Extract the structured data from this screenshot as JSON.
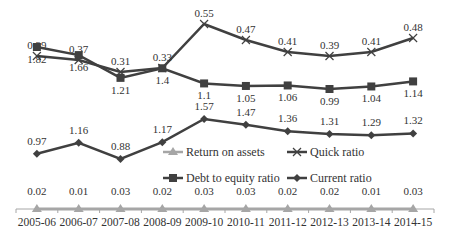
{
  "chart_data": {
    "type": "line",
    "title": "",
    "xlabel": "",
    "ylabel": "",
    "grid": false,
    "y_axis_visible": false,
    "legend_position": "center",
    "categories": [
      "2005-06",
      "2006-07",
      "2007-08",
      "2008-09",
      "2009-10",
      "2010-11",
      "2011-12",
      "2012-13",
      "2013-14",
      "2014-15"
    ],
    "series": [
      {
        "name": "Quick ratio",
        "marker": "x",
        "color": "#404040",
        "values": [
          0.39,
          0.37,
          0.31,
          0.33,
          0.55,
          0.47,
          0.41,
          0.39,
          0.41,
          0.48
        ],
        "labels": [
          "0.39",
          "0.37",
          "0.31",
          "0.33",
          "0.55",
          "0.47",
          "0.41",
          "0.39",
          "0.41",
          "0.48"
        ]
      },
      {
        "name": "Debt to equity ratio",
        "marker": "square",
        "color": "#404040",
        "values": [
          1.82,
          1.66,
          1.21,
          1.4,
          1.1,
          1.05,
          1.06,
          0.99,
          1.04,
          1.14
        ],
        "labels": [
          "1.82",
          "1.66",
          "1.21",
          "1.4",
          "1.1",
          "1.05",
          "1.06",
          "0.99",
          "1.04",
          "1.14"
        ]
      },
      {
        "name": "Current ratio",
        "marker": "diamond",
        "color": "#404040",
        "values": [
          0.97,
          1.16,
          0.88,
          1.17,
          1.57,
          1.47,
          1.36,
          1.31,
          1.29,
          1.32
        ],
        "labels": [
          "0.97",
          "1.16",
          "0.88",
          "1.17",
          "1.57",
          "1.47",
          "1.36",
          "1.31",
          "1.29",
          "1.32"
        ]
      },
      {
        "name": "Return on assets",
        "marker": "triangle",
        "color": "#a6a6a6",
        "values": [
          0.02,
          0.01,
          0.03,
          0.02,
          0.03,
          0.03,
          0.02,
          0.02,
          0.01,
          0.03
        ],
        "labels": [
          "0.02",
          "0.01",
          "0.03",
          "0.02",
          "0.03",
          "0.03",
          "0.02",
          "0.02",
          "0.01",
          "0.03"
        ]
      }
    ],
    "legend": [
      "Return on assets",
      "Quick ratio",
      "Debt to equity ratio",
      "Current ratio"
    ]
  }
}
